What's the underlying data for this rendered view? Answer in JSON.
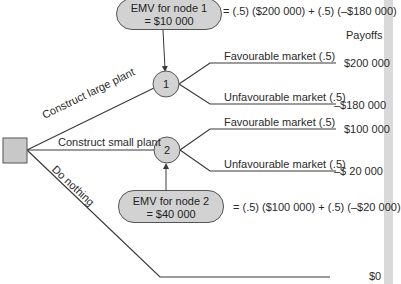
{
  "colors": {
    "line": "#3a3a3a",
    "node_fill": "#d2d2d2",
    "node_stroke": "#555555",
    "strip": "#d9d9d9"
  },
  "header": {
    "payoffs_label": "Payoffs"
  },
  "decision_node": {
    "icon": "decision-square"
  },
  "branches": {
    "large": "Construct large plant",
    "small": "Construct small plant",
    "nothing": "Do nothing"
  },
  "nodes": [
    {
      "number": "1",
      "emv_line1": "EMV for node 1",
      "emv_line2": "= $10 000",
      "formula": "= (.5) ($200 000) + (.5) (–$180 000)",
      "outcomes": [
        {
          "label": "Favourable market (.5)",
          "payoff": "$200 000"
        },
        {
          "label": "Unfavourable market (.5)",
          "payoff": "–$180 000"
        }
      ]
    },
    {
      "number": "2",
      "emv_line1": "EMV for node 2",
      "emv_line2": "= $40 000",
      "formula": "= (.5) ($100 000) + (.5) (–$20 000)",
      "outcomes": [
        {
          "label": "Favourable market (.5)",
          "payoff": "$100 000"
        },
        {
          "label": "Unfavourable market (.5)",
          "payoff": "–$ 20 000"
        }
      ]
    }
  ],
  "do_nothing_payoff": "$0"
}
